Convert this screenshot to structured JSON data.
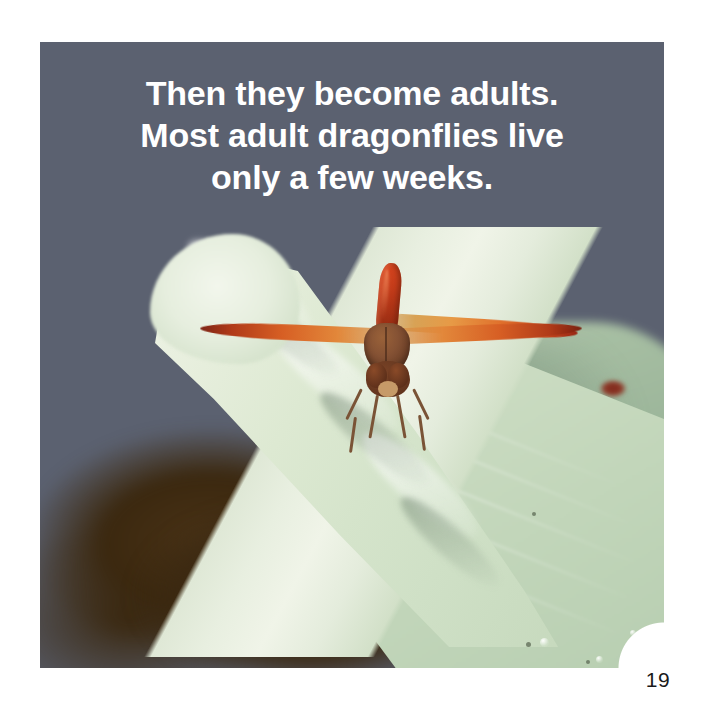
{
  "page": {
    "number": "19",
    "background_color": "#ffffff"
  },
  "caption": {
    "lines": [
      "Then they become adults.",
      "Most adult dragonflies live",
      "only a few weeks."
    ],
    "full_text": "Then they become adults. Most adult dragonflies live only a few weeks.",
    "text_color": "#ffffff"
  },
  "photo": {
    "subject": "red dragonfly perched on a curled pale-green leaf",
    "sky_color": "#5a606e",
    "leaf_color": "#e2ebd8",
    "background_leaf_color": "#a9c2a4",
    "dragonfly_color": "#c94a1e",
    "wing_color": "#e0702c",
    "thorax_color": "#855234",
    "foliage_shadow_color": "#3b280f",
    "elements": {
      "abdomen": "dragonfly-abdomen",
      "thorax": "dragonfly-thorax",
      "head": "dragonfly-head",
      "wings": [
        "left-upper-wing",
        "left-lower-wing",
        "right-upper-wing",
        "right-lower-wing"
      ],
      "legs_count": 6
    }
  }
}
